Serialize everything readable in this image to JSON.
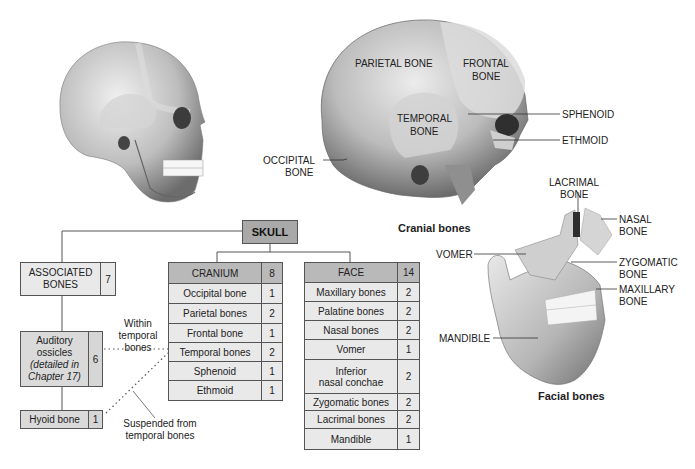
{
  "figure": {
    "illustrations": {
      "whole_skull": "lateral-view-skull",
      "cranial": {
        "caption": "Cranial bones",
        "labels": {
          "parietal": "PARIETAL BONE",
          "frontal_1": "FRONTAL",
          "frontal_2": "BONE",
          "temporal_1": "TEMPORAL",
          "temporal_2": "BONE",
          "occipital_1": "OCCIPITAL",
          "occipital_2": "BONE",
          "sphenoid": "SPHENOID",
          "ethmoid": "ETHMOID"
        }
      },
      "facial": {
        "caption": "Facial bones",
        "labels": {
          "lacrimal_1": "LACRIMAL",
          "lacrimal_2": "BONE",
          "nasal_1": "NASAL",
          "nasal_2": "BONE",
          "vomer": "VOMER",
          "zygomatic_1": "ZYGOMATIC",
          "zygomatic_2": "BONE",
          "maxillary_1": "MAXILLARY",
          "maxillary_2": "BONE",
          "mandible": "MANDIBLE"
        }
      }
    },
    "hierarchy": {
      "root": "SKULL",
      "associated": {
        "title_1": "ASSOCIATED",
        "title_2": "BONES",
        "count": "7",
        "auditory": {
          "line1": "Auditory",
          "line2": "ossicles",
          "line3": "(detailed in",
          "line4": "Chapter 17)",
          "count": "6"
        },
        "hyoid": {
          "label": "Hyoid bone",
          "count": "1"
        },
        "note_within": [
          "Within",
          "temporal",
          "bones"
        ],
        "note_suspended": [
          "Suspended from",
          "temporal bones"
        ]
      },
      "cranium": {
        "title": "CRANIUM",
        "count": "8",
        "rows": [
          {
            "name": "Occipital bone",
            "count": "1"
          },
          {
            "name": "Parietal bones",
            "count": "2"
          },
          {
            "name": "Frontal bone",
            "count": "1"
          },
          {
            "name": "Temporal bones",
            "count": "2"
          },
          {
            "name": "Sphenoid",
            "count": "1"
          },
          {
            "name": "Ethmoid",
            "count": "1"
          }
        ]
      },
      "face": {
        "title": "FACE",
        "count": "14",
        "rows": [
          {
            "name": "Maxillary bones",
            "count": "2"
          },
          {
            "name": "Palatine bones",
            "count": "2"
          },
          {
            "name": "Nasal bones",
            "count": "2"
          },
          {
            "name": "Vomer",
            "count": "1"
          },
          {
            "name": "Inferior nasal conchae",
            "name_1": "Inferior",
            "name_2": "nasal conchae",
            "count": "2"
          },
          {
            "name": "Zygomatic bones",
            "count": "2"
          },
          {
            "name": "Lacrimal bones",
            "count": "2"
          },
          {
            "name": "Mandible",
            "count": "1"
          }
        ]
      }
    },
    "colors": {
      "header_fill": "#a9a9a9",
      "cell_fill": "#e9e9e9",
      "bone_light": "#e6e6e6",
      "bone_dark": "#8a8a8a"
    }
  }
}
